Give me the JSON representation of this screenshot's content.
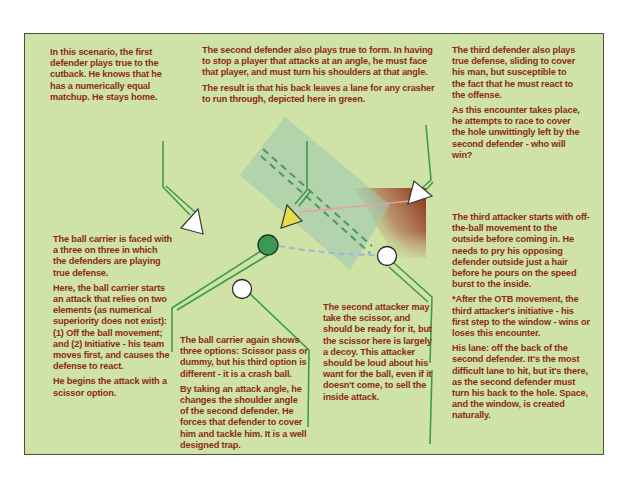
{
  "diagram": {
    "title": "",
    "colors": {
      "background": "#cfe3a6",
      "border": "#4a4f42",
      "text": "#8e2a1a",
      "line_green": "#3f9a4c",
      "lane_green": "#9fc8b0",
      "ball_carrier": "#3a9a55",
      "defender_marker": "#ffffff",
      "highlight_defender": "#e8dc4a",
      "pass_line": "#9bbad6",
      "run_line": "#e6a2a0",
      "pressure_gradient": "#8a2a10"
    },
    "annotations": {
      "first_defender": {
        "paragraphs": [
          "In this scenario, the first defender plays true to the cutback.  He knows that he has a numerically equal matchup. He stays home."
        ]
      },
      "second_defender": {
        "paragraphs": [
          "The second defender also plays true to form. In having to stop a player that attacks at an angle, he must face that player, and must turn his shoulders at that angle.",
          "The result is that his back leaves a lane for any crasher to run through, depicted here in green."
        ]
      },
      "third_defender": {
        "paragraphs": [
          "The third defender also plays true defense, sliding to cover his man, but susceptible to the fact that he must react to the offense.",
          "As this encounter takes place, he attempts to race to cover the hole unwittingly left by the second defender - who will win?"
        ]
      },
      "ball_carrier": {
        "paragraphs": [
          "The ball carrier is faced with a three on three in which the defenders are playing true defense.",
          "Here, the ball carrier starts an attack that relies on two elements (as numerical superiority does not exist): (1) Off the ball movement; and (2) Initiative - his team moves first, and causes the defense to react.",
          "He begins the attack with a scissor option."
        ]
      },
      "ball_carrier_again": {
        "paragraphs": [
          "The ball carrier again shows three options: Scissor pass or dummy, but his third option is different - it is a crash ball.",
          "By taking an attack angle, he changes the shoulder angle of the second defender. He forces that defender to cover him and tackle him. It is a well designed trap."
        ]
      },
      "second_attacker": {
        "paragraphs": [
          "The second attacker may take the scissor, and should be ready for it, but the scissor here is largely a decoy. This attacker should be loud about his want for the ball, even if it doesn't come, to sell the inside attack."
        ]
      },
      "third_attacker": {
        "paragraphs": [
          "The third attacker starts with off-the-ball movement to the outside before coming in. He needs to pry his opposing defender outside just a hair before he pours on the speed burst to the inside.",
          "*After the OTB movement, the third attacker's initiative - his first step to the window - wins or loses this encounter.",
          "His lane: off the back of the second defender. It's the most difficult lane to hit, but it's there, as the second defender must turn his back to the hole. Space, and the window, is created naturally."
        ]
      }
    },
    "players": {
      "defenders": [
        {
          "name": "first-defender",
          "shape": "triangle",
          "fill": "#ffffff"
        },
        {
          "name": "second-defender",
          "shape": "triangle",
          "fill": "#e8dc4a"
        },
        {
          "name": "third-defender",
          "shape": "triangle",
          "fill": "#ffffff"
        }
      ],
      "attackers": [
        {
          "name": "ball-carrier",
          "shape": "circle",
          "fill": "#3a9a55"
        },
        {
          "name": "second-attacker",
          "shape": "circle",
          "fill": "#ffffff"
        },
        {
          "name": "third-attacker",
          "shape": "circle",
          "fill": "#ffffff"
        }
      ]
    }
  }
}
